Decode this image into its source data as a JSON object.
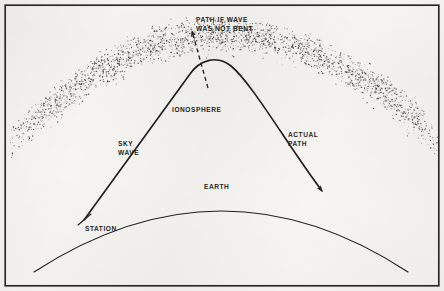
{
  "figure": {
    "background_color": "#f6f5f1",
    "ink_color": "#1f1f1f",
    "border": {
      "name": "figure-border",
      "color": "#2b2b2b",
      "inset_px": 5,
      "stroke_width": 1.6
    }
  },
  "labels": {
    "path_if_not_bent": "PATH IF WAVE\nWAS NOT BENT",
    "ionosphere": "IONOSPHERE",
    "sky_wave": "SKY\nWAVE",
    "actual_path": "ACTUAL\nPATH",
    "earth": "EARTH",
    "station": "STATION"
  },
  "label_positions": {
    "path_if_not_bent": {
      "x": 196,
      "y": 15
    },
    "ionosphere": {
      "x": 172,
      "y": 105
    },
    "sky_wave": {
      "x": 118,
      "y": 139
    },
    "actual_path": {
      "x": 288,
      "y": 130
    },
    "earth": {
      "x": 204,
      "y": 182
    },
    "station": {
      "x": 85,
      "y": 224
    }
  },
  "chart_data": {
    "type": "diagram",
    "elements": [
      {
        "name": "ionosphere-band",
        "kind": "stippled-arc-band",
        "description": "Speckled arc band representing the ionised layer",
        "inner_arc": {
          "start": [
            14,
            163
          ],
          "apex": [
            222,
            58
          ],
          "end": [
            436,
            163
          ]
        },
        "outer_arc": {
          "start": [
            14,
            115
          ],
          "apex": [
            222,
            12
          ],
          "end": [
            436,
            115
          ]
        },
        "dot_count": 2600,
        "dot_color": "#3a3a3a"
      },
      {
        "name": "earth-curve",
        "kind": "arc",
        "description": "Curved surface of the earth",
        "points": [
          [
            34,
            272
          ],
          [
            222,
            188
          ],
          [
            408,
            272
          ]
        ],
        "stroke": "#1f1f1f",
        "stroke_width": 1.15
      },
      {
        "name": "sky-wave-path",
        "kind": "curve",
        "description": "Transmitted sky wave rising from the station, refracted at the ionosphere and returned to earth",
        "origin_station": [
          84,
          220
        ],
        "apex": [
          208,
          57
        ],
        "terminus": [
          326,
          196
        ],
        "stroke": "#1f1f1f",
        "stroke_width": 1.6,
        "arrowhead_at": "terminus"
      },
      {
        "name": "unbent-path",
        "kind": "dashed-line",
        "description": "Dashed continuation showing where the wave would travel if it were not bent",
        "from": [
          207,
          86
        ],
        "to": [
          191,
          28
        ],
        "stroke": "#1f1f1f",
        "stroke_width": 1.3,
        "dash_pattern": "4 3",
        "arrowhead_at": "to"
      },
      {
        "name": "station-marker",
        "kind": "tick",
        "description": "Short tick crossing the earth curve marking the transmitting station",
        "at": [
          84,
          220
        ]
      }
    ],
    "annotations": [
      {
        "text": "PATH IF WAVE WAS NOT BENT",
        "points_to": "unbent-path"
      },
      {
        "text": "IONOSPHERE",
        "points_to": "ionosphere-band"
      },
      {
        "text": "SKY WAVE",
        "points_to": "sky-wave-path"
      },
      {
        "text": "ACTUAL PATH",
        "points_to": "sky-wave-path"
      },
      {
        "text": "EARTH",
        "points_to": "earth-curve"
      },
      {
        "text": "STATION",
        "points_to": "station-marker"
      }
    ]
  }
}
